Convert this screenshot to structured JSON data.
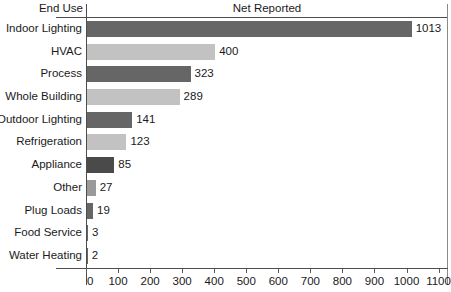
{
  "header": {
    "category_header": "End Use",
    "value_header": "Net Reported"
  },
  "axis": {
    "ticks": [
      0,
      100,
      200,
      300,
      400,
      500,
      600,
      700,
      800,
      900,
      1000,
      1100
    ],
    "tick_labels": [
      "0",
      "100",
      "200",
      "300",
      "400",
      "500",
      "600",
      "700",
      "800",
      "900",
      "1000",
      "1100"
    ],
    "min": 0,
    "max": 1100
  },
  "colors": {
    "bar_dark": "#666666",
    "bar_light": "#c2c2c2",
    "axis": "#4d4d4d",
    "text": "#1a1a1a",
    "background": "#ffffff"
  },
  "chart_data": {
    "type": "bar",
    "orientation": "horizontal",
    "title": "",
    "xlabel": "Net Reported",
    "ylabel": "End Use",
    "categories": [
      "Indoor Lighting",
      "HVAC",
      "Process",
      "Whole Building",
      "Outdoor Lighting",
      "Refrigeration",
      "Appliance",
      "Other",
      "Plug Loads",
      "Food Service",
      "Water Heating"
    ],
    "values": [
      1013,
      400,
      323,
      289,
      141,
      123,
      85,
      27,
      19,
      3,
      2
    ],
    "value_labels": [
      "1013",
      "400",
      "323",
      "289",
      "141",
      "123",
      "85",
      "27",
      "19",
      "3",
      "2"
    ],
    "xlim": [
      0,
      1100
    ],
    "xticks": [
      0,
      100,
      200,
      300,
      400,
      500,
      600,
      700,
      800,
      900,
      1000,
      1100
    ],
    "grid": false,
    "legend": null,
    "bar_colors": [
      "#666666",
      "#c2c2c2",
      "#666666",
      "#c2c2c2",
      "#666666",
      "#c2c2c2",
      "#4a4a4a",
      "#9a9a9a",
      "#666666",
      "#666666",
      "#666666"
    ]
  }
}
